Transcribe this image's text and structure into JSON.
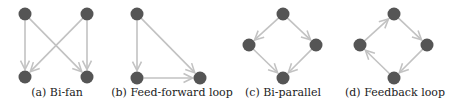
{
  "colors": {
    "node": "#555555",
    "edge": "#c2c2c2"
  },
  "panels": [
    {
      "id": "a",
      "caption": "(a) Bi-fan",
      "caption_x": 57,
      "nodes": [
        [
          25,
          14
        ],
        [
          87,
          14
        ],
        [
          25,
          77
        ],
        [
          87,
          77
        ]
      ],
      "edges": [
        [
          0,
          2
        ],
        [
          0,
          3
        ],
        [
          1,
          2
        ],
        [
          1,
          3
        ]
      ]
    },
    {
      "id": "b",
      "caption": "(b) Feed-forward loop",
      "caption_x": 172,
      "nodes": [
        [
          137,
          14
        ],
        [
          137,
          78
        ],
        [
          200,
          78
        ]
      ],
      "edges": [
        [
          0,
          1
        ],
        [
          0,
          2
        ],
        [
          1,
          2
        ]
      ]
    },
    {
      "id": "c",
      "caption": "(c) Bi-parallel",
      "caption_x": 283,
      "nodes": [
        [
          283,
          14
        ],
        [
          249,
          45
        ],
        [
          316,
          45
        ],
        [
          283,
          78
        ]
      ],
      "edges": [
        [
          0,
          1
        ],
        [
          0,
          2
        ],
        [
          1,
          3
        ],
        [
          2,
          3
        ]
      ]
    },
    {
      "id": "d",
      "caption": "(d) Feedback loop",
      "caption_x": 395,
      "nodes": [
        [
          394,
          14
        ],
        [
          360,
          45
        ],
        [
          427,
          45
        ],
        [
          394,
          78
        ]
      ],
      "edges": [
        [
          1,
          0
        ],
        [
          0,
          2
        ],
        [
          2,
          3
        ],
        [
          3,
          1
        ]
      ]
    }
  ]
}
